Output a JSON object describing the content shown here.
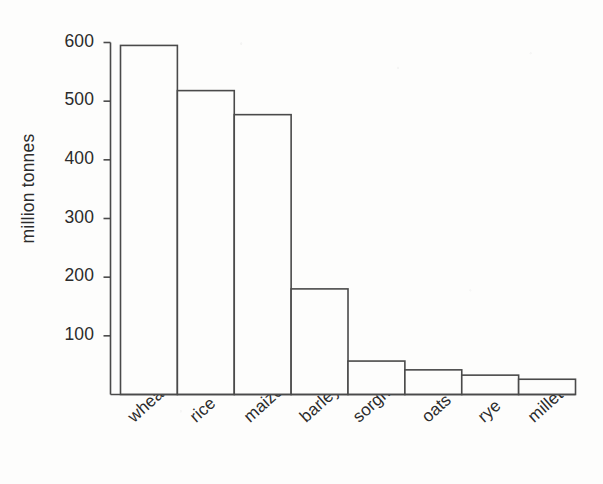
{
  "chart_data": {
    "type": "bar",
    "title": "",
    "xlabel": "",
    "ylabel": "million tonnes",
    "categories": [
      "wheat",
      "rice",
      "maize",
      "barley",
      "sorghum",
      "oats",
      "rye",
      "millet"
    ],
    "values": [
      595,
      518,
      477,
      180,
      57,
      42,
      33,
      26
    ],
    "ylim": [
      0,
      600
    ],
    "yticks": [
      100,
      200,
      300,
      400,
      500,
      600
    ],
    "ytick_labels": [
      "100",
      "200",
      "300",
      "400",
      "500",
      "600"
    ],
    "grid": false,
    "legend": null,
    "bar_style": {
      "fill": "#fdfdfc",
      "edge": "#4a4a4a",
      "gap": 0
    },
    "axis_color": "#4a4a4a",
    "text_color": "#2b2b2b"
  },
  "figure": {
    "background": "#fdfdfc",
    "xtick_rotation_deg": -42
  }
}
